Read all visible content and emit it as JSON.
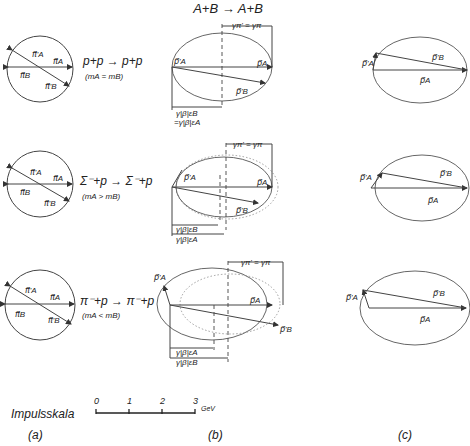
{
  "header": {
    "title": "A+B → A+B"
  },
  "rows": [
    {
      "reaction": "p+p → p+p",
      "mass_relation": "(mₐ = mʙ)",
      "mass_relation_text": "(mA = mB)",
      "circle_labels": {
        "pa": "π⃗A",
        "pa_prime": "π⃗'A",
        "pb": "π⃗B",
        "pb_prime": "π⃗'B"
      },
      "b_labels": {
        "pa_prime": "p⃗'A",
        "pa": "p⃗A",
        "pb_prime": "p⃗'B",
        "top_dim": "γπ' = γπ",
        "dim1": "γ|β|εB",
        "dim2": "=γ|β|εA"
      },
      "c_labels": {
        "pa_prime": "p⃗'A",
        "pb_prime": "p⃗'B",
        "pa": "p⃗A"
      }
    },
    {
      "reaction": "Σ⁻+p → Σ⁻+p",
      "mass_relation_text": "(mA > mB)",
      "circle_labels": {
        "pa": "π⃗A",
        "pa_prime": "π⃗'A",
        "pb": "π⃗B",
        "pb_prime": "π⃗'B"
      },
      "b_labels": {
        "pa_prime": "p⃗'A",
        "pa": "p⃗A",
        "pb_prime": "p⃗'B",
        "top_dim": "γπ' = γπ",
        "dim1": "γ|β|εB",
        "dim2": "γ|β|εA"
      },
      "c_labels": {
        "pa_prime": "p⃗'A",
        "pb_prime": "p⃗'B",
        "pa": "p⃗A"
      }
    },
    {
      "reaction": "π⁻+p → π⁻+p",
      "mass_relation_text": "(mA < mB)",
      "circle_labels": {
        "pa": "π⃗A",
        "pa_prime": "π⃗'A",
        "pb": "π⃗B",
        "pb_prime": "π⃗'B"
      },
      "b_labels": {
        "pa_prime": "p⃗'A",
        "pa": "p⃗A",
        "pb_prime": "p⃗'B",
        "top_dim": "γπ' = γπ",
        "dim1": "γ|β|εA",
        "dim2": "γ|β|εB"
      },
      "c_labels": {
        "pa_prime": "p⃗'A",
        "pb_prime": "p⃗'B",
        "pa": "p⃗A"
      }
    }
  ],
  "scale": {
    "label": "Impulsskala",
    "ticks": [
      "0",
      "1",
      "2",
      "3"
    ],
    "unit": "GeV"
  },
  "panels": {
    "a": "(a)",
    "b": "(b)",
    "c": "(c)"
  }
}
